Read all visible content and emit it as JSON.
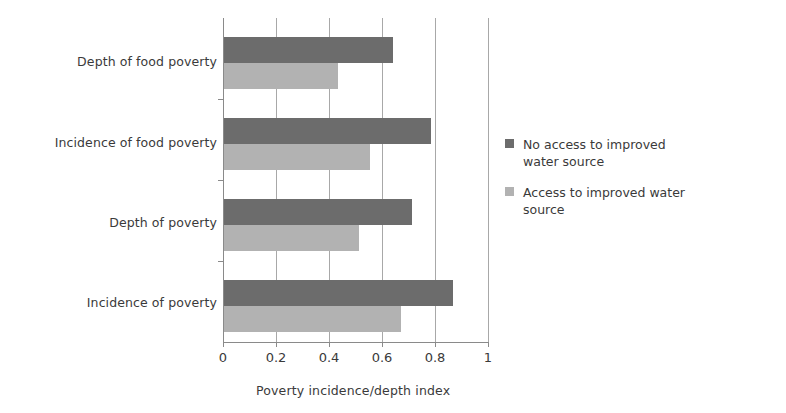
{
  "chart_data": {
    "type": "bar",
    "orientation": "horizontal",
    "title": "",
    "xlabel": "Poverty incidence/depth index",
    "ylabel": "",
    "xlim": [
      0,
      1
    ],
    "xticks": [
      "0",
      "0.2",
      "0.4",
      "0.6",
      "0.8",
      "1"
    ],
    "xtick_values": [
      0,
      0.2,
      0.4,
      0.6,
      0.8,
      1
    ],
    "grid": true,
    "grid_axis": "x",
    "legend_position": "right",
    "categories": [
      "Incidence of poverty",
      "Depth of poverty",
      "Incidence of food poverty",
      "Depth of food poverty"
    ],
    "series": [
      {
        "name": "No access to improved water source",
        "color": "#6c6c6c",
        "values": [
          0.865,
          0.71,
          0.78,
          0.637
        ]
      },
      {
        "name": "Access to improved water source",
        "color": "#b2b2b2",
        "values": [
          0.667,
          0.51,
          0.55,
          0.43
        ]
      }
    ]
  },
  "axis": {
    "x_title": "Poverty incidence/depth index",
    "tick_labels": [
      "0",
      "0.2",
      "0.4",
      "0.6",
      "0.8",
      "1"
    ]
  },
  "categories": [
    {
      "label": "Depth of food poverty"
    },
    {
      "label": "Incidence of food poverty"
    },
    {
      "label": "Depth of poverty"
    },
    {
      "label": "Incidence of poverty"
    }
  ],
  "legend": {
    "items": [
      {
        "label": "No access to improved water source",
        "color": "#6c6c6c"
      },
      {
        "label": "Access to improved water source",
        "color": "#b2b2b2"
      }
    ]
  },
  "colors": {
    "series_dark": "#6c6c6c",
    "series_light": "#b2b2b2",
    "axis": "#8a8a8a",
    "grid": "#a8a8a8",
    "text": "#3a3a3a",
    "background": "#ffffff"
  }
}
